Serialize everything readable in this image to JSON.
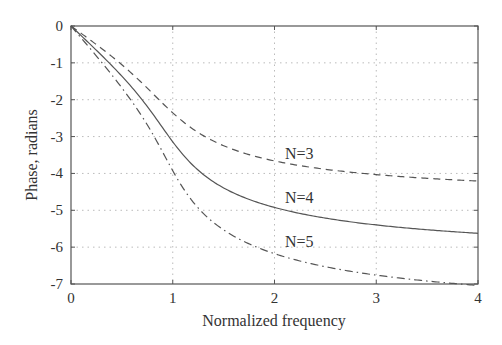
{
  "chart_data": {
    "type": "line",
    "title": "",
    "xlabel": "Normalized frequency",
    "ylabel": "Phase, radians",
    "xlim": [
      0,
      4
    ],
    "ylim": [
      -7,
      0
    ],
    "xticks": [
      0,
      1,
      2,
      3,
      4
    ],
    "yticks": [
      0,
      -1,
      -2,
      -3,
      -4,
      -5,
      -6,
      -7
    ],
    "grid": true,
    "legend": "inline labels",
    "x": [
      0,
      0.5,
      1,
      1.5,
      2,
      2.5,
      3,
      3.5,
      4
    ],
    "series": [
      {
        "name": "N=3",
        "style": "dashed",
        "values": [
          0,
          -1.0,
          -2.36,
          -3.19,
          -3.55,
          -3.74,
          -3.86,
          -3.95,
          -4.02
        ]
      },
      {
        "name": "N=4",
        "style": "solid",
        "values": [
          0,
          -1.31,
          -3.14,
          -4.17,
          -4.64,
          -4.91,
          -5.09,
          -5.21,
          -5.31
        ]
      },
      {
        "name": "N=5",
        "style": "dashdot",
        "values": [
          0,
          -1.63,
          -3.93,
          -5.15,
          -5.73,
          -6.05,
          -6.27,
          -6.42,
          -6.54
        ]
      }
    ],
    "annotations": [
      {
        "text": "N=3",
        "x": 2.08,
        "y": -3.4
      },
      {
        "text": "N=4",
        "x": 2.08,
        "y": -4.6
      },
      {
        "text": "N=5",
        "x": 2.08,
        "y": -5.85
      }
    ]
  },
  "labels": {
    "xlabel": "Normalized frequency",
    "ylabel": "Phase, radians",
    "n3": "N=3",
    "n4": "N=4",
    "n5": "N=5"
  }
}
